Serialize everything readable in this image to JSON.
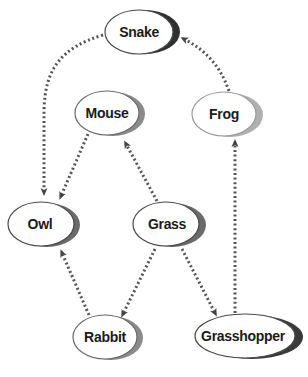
{
  "diagram": {
    "type": "food-web",
    "colors": {
      "edge": "#555555",
      "node_stroke": "#4a4a4a",
      "node_stroke_light": "#9a9a9a",
      "shadow_dark": "#3a3a3a",
      "shadow_gray": "#8a8a8a",
      "background": "#ffffff"
    },
    "nodes": [
      {
        "id": "snake",
        "label": "Snake"
      },
      {
        "id": "mouse",
        "label": "Mouse"
      },
      {
        "id": "frog",
        "label": "Frog"
      },
      {
        "id": "owl",
        "label": "Owl"
      },
      {
        "id": "grass",
        "label": "Grass"
      },
      {
        "id": "rabbit",
        "label": "Rabbit"
      },
      {
        "id": "grasshopper",
        "label": "Grasshopper"
      }
    ],
    "edges": [
      {
        "from": "Snake",
        "to": "Owl",
        "style": "dotted-arrow"
      },
      {
        "from": "Frog",
        "to": "Snake",
        "style": "dotted-arrow"
      },
      {
        "from": "Mouse",
        "to": "Owl",
        "style": "dotted-arrow"
      },
      {
        "from": "Grass",
        "to": "Mouse",
        "style": "dotted-arrow"
      },
      {
        "from": "Grasshopper",
        "to": "Frog",
        "style": "dotted-arrow"
      },
      {
        "from": "Rabbit",
        "to": "Owl",
        "style": "dotted-arrow"
      },
      {
        "from": "Grass",
        "to": "Rabbit",
        "style": "dotted-arrow"
      },
      {
        "from": "Grass",
        "to": "Grasshopper",
        "style": "dotted-arrow"
      }
    ]
  }
}
